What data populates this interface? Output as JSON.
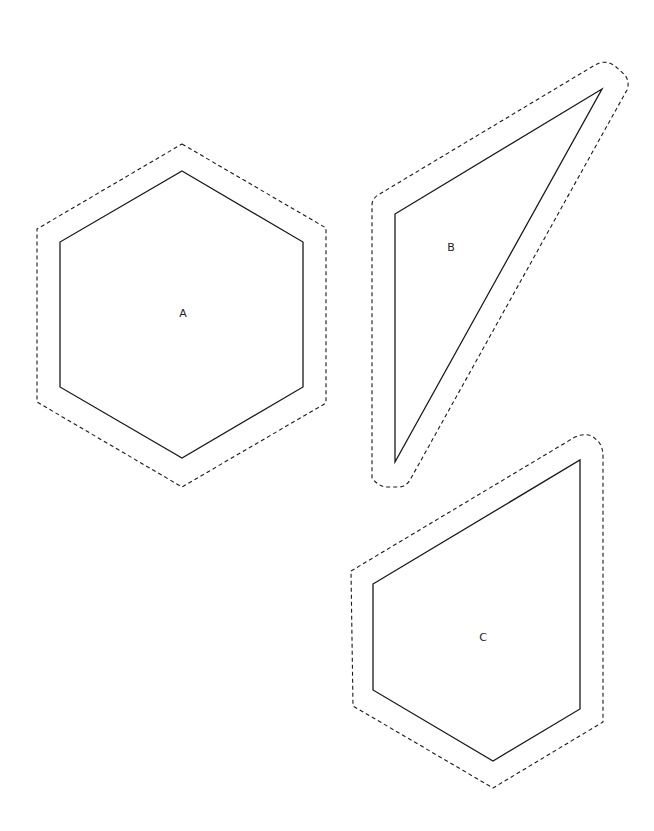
{
  "shapes": [
    {
      "id": "A",
      "label": "A",
      "kind": "hexagon",
      "inner_points": "182,171 303,242 303,387 182,458 60,387 60,242",
      "outer_path": "M182,144 L326,228 L326,403 L182,487 L37,402 L37,229 Z",
      "label_pos": [
        183,
        314
      ]
    },
    {
      "id": "B",
      "label": "B",
      "kind": "triangle",
      "inner_points": "395,214 602,89 395,462",
      "outer_path": "M372,205 Q372,199 378,195 L595,65 Q605,59 615,66 L625,75 Q630,82 627,90 L410,480 Q406,487 398,487 L385,487 Q377,485 372,478 Z",
      "label_pos": [
        451,
        248
      ]
    },
    {
      "id": "C",
      "label": "C",
      "kind": "pentagon",
      "inner_points": "373,584 580,460 580,709 493,761 373,690",
      "outer_path": "M351,571 L575,437 Q583,433 592,436 L598,441 Q603,447 603,456 L603,722 L493,788 L353,706 Z",
      "label_pos": [
        483,
        638
      ]
    }
  ],
  "colors": {
    "stroke": "#1a1a1a",
    "background": "#ffffff"
  }
}
